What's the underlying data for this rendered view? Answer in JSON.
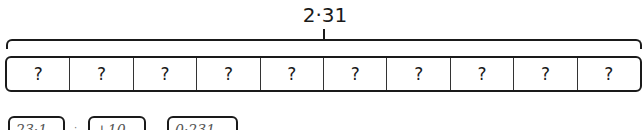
{
  "diagram": {
    "total": "2·31",
    "cell_count": 10,
    "cells": [
      "?",
      "?",
      "?",
      "?",
      "?",
      "?",
      "?",
      "?",
      "?",
      "?"
    ]
  },
  "options": [
    {
      "label": "23·1",
      "sep": "·"
    },
    {
      "label": "+10",
      "sep": ""
    },
    {
      "label": "0·231",
      "sep": ""
    }
  ]
}
